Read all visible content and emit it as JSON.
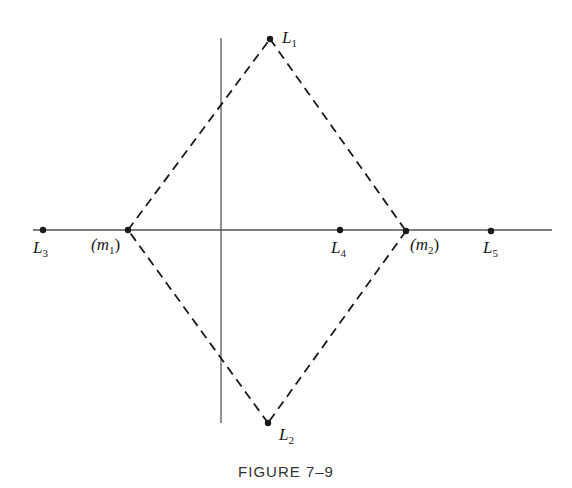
{
  "figure": {
    "caption": "FIGURE 7–9",
    "colors": {
      "ink": "#1a1a1a",
      "axis": "#333333",
      "background": "#ffffff"
    },
    "axes": {
      "horizontal": {
        "x1": 33,
        "y": 230,
        "x2": 552
      },
      "vertical": {
        "x": 221,
        "y1": 38,
        "y2": 423
      }
    },
    "points": [
      {
        "id": "L1",
        "base": "L",
        "sub": "1",
        "x": 270,
        "y": 39,
        "label_x": 282,
        "label_y": 43
      },
      {
        "id": "L2",
        "base": "L",
        "sub": "2",
        "x": 268,
        "y": 423,
        "label_x": 279,
        "label_y": 440
      },
      {
        "id": "L3",
        "base": "L",
        "sub": "3",
        "x": 43,
        "y": 230,
        "label_x": 33,
        "label_y": 253
      },
      {
        "id": "L4",
        "base": "L",
        "sub": "4",
        "x": 340,
        "y": 230,
        "label_x": 331,
        "label_y": 253
      },
      {
        "id": "L5",
        "base": "L",
        "sub": "5",
        "x": 491,
        "y": 231,
        "label_x": 483,
        "label_y": 253
      },
      {
        "id": "m1",
        "base": "(m",
        "sub": "1",
        "close": ")",
        "x": 128,
        "y": 230,
        "label_x": 91,
        "label_y": 250
      },
      {
        "id": "m2",
        "base": "(m",
        "sub": "2",
        "close": ")",
        "x": 406,
        "y": 231,
        "label_x": 410,
        "label_y": 250
      }
    ],
    "dashed_edges": [
      {
        "from": "m1",
        "to": "L1"
      },
      {
        "from": "L1",
        "to": "m2"
      },
      {
        "from": "m2",
        "to": "L2"
      },
      {
        "from": "L2",
        "to": "m1"
      }
    ]
  }
}
